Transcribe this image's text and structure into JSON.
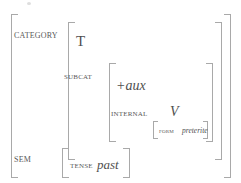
{
  "figure": {
    "type": "attribute-value-matrix"
  },
  "colors": {
    "bracket": "#a9a9a9",
    "label_text": "#595959",
    "value_text": "#4f4f4f",
    "background": "#ffffff"
  },
  "attributes": {
    "category": {
      "label": "CATEGORY",
      "head": "T",
      "subcat": {
        "label": "SUBCAT",
        "feature": "+aux",
        "internal": {
          "label": "INTERNAL",
          "value": "V",
          "form": {
            "label": "FORM",
            "value": "preterite"
          }
        }
      }
    },
    "sem": {
      "label": "SEM",
      "tense": {
        "label": "TENSE",
        "value": "past"
      }
    }
  }
}
